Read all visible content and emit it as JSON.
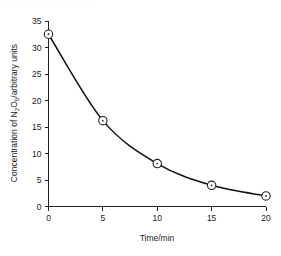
{
  "page": {
    "top_artifact_text": "— —— — ——— — — —— —"
  },
  "chart_data": {
    "type": "line",
    "title": "",
    "subtitle": "",
    "xlabel": "Time/min",
    "ylabel_full": "Concentration of N2O5/arbitrary units",
    "ylabel_prefix": "Concentration of N",
    "ylabel_sub1": "2",
    "ylabel_mid": "O",
    "ylabel_sub2": "5",
    "ylabel_suffix": "/arbitrary units",
    "x": [
      0,
      5,
      10,
      15,
      20
    ],
    "values": [
      32.5,
      16.2,
      8.1,
      4.0,
      2.0
    ],
    "series": [
      {
        "name": "Concentration of N2O5",
        "values": [
          32.5,
          16.2,
          8.1,
          4.0,
          2.0
        ]
      }
    ],
    "xlim": [
      0,
      20
    ],
    "ylim": [
      0,
      35
    ],
    "xticks": [
      0,
      5,
      10,
      15,
      20
    ],
    "yticks": [
      0,
      5,
      10,
      15,
      20,
      25,
      30,
      35
    ],
    "xtick_labels": [
      "0",
      "5",
      "10",
      "15",
      "20"
    ],
    "ytick_labels": [
      "0",
      "5",
      "10",
      "15",
      "20",
      "25",
      "30",
      "35"
    ],
    "grid": false,
    "legend": false,
    "legend_position": "none",
    "marker": "open-circle-with-center-dot",
    "line_color": "#111111",
    "marker_face_color": "#ffffff",
    "marker_edge_color": "#222222",
    "axis_color": "#222222",
    "background_color": "#ffffff",
    "annotation": "Exponential decay (first-order decomposition)"
  }
}
